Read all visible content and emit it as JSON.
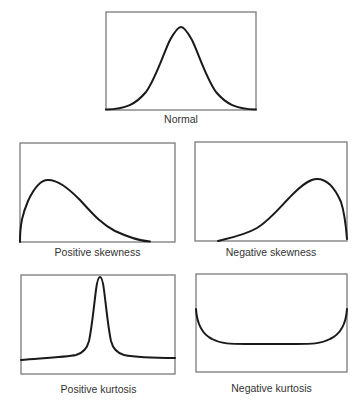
{
  "figure": {
    "panels": [
      {
        "id": "normal",
        "caption": "Normal",
        "curve_type": "symmetric bell curve"
      },
      {
        "id": "positive-skewness",
        "caption": "Positive skewness",
        "curve_type": "right-skewed (long right tail)"
      },
      {
        "id": "negative-skewness",
        "caption": "Negative skewness",
        "curve_type": "left-skewed (long left tail)"
      },
      {
        "id": "positive-kurtosis",
        "caption": "Positive kurtosis",
        "curve_type": "tall narrow peak (leptokurtic)"
      },
      {
        "id": "negative-kurtosis",
        "caption": "Negative kurtosis",
        "curve_type": "flat U-shaped (platykurtic)"
      }
    ],
    "colors": {
      "frame": "#7a7a7a",
      "curve": "#1a1a1a",
      "caption": "#333333",
      "background": "#ffffff"
    }
  }
}
